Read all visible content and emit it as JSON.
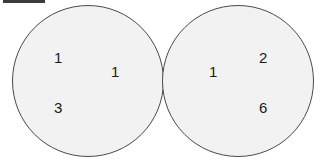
{
  "diagram": {
    "background_color": "#ffffff",
    "marker": {
      "name": "top-left-bar",
      "color": "#3a3a3a"
    },
    "circles": [
      {
        "id": "left-circle",
        "fill_color": "#f2f2f2",
        "stroke_color": "#4a4a4a",
        "labels": [
          {
            "value": "1",
            "position": "upper-left"
          },
          {
            "value": "1",
            "position": "middle-right"
          },
          {
            "value": "3",
            "position": "lower-left"
          }
        ]
      },
      {
        "id": "right-circle",
        "fill_color": "#f2f2f2",
        "stroke_color": "#4a4a4a",
        "labels": [
          {
            "value": "1",
            "position": "middle-left"
          },
          {
            "value": "2",
            "position": "upper-right"
          },
          {
            "value": "6",
            "position": "lower-right"
          }
        ]
      }
    ]
  }
}
